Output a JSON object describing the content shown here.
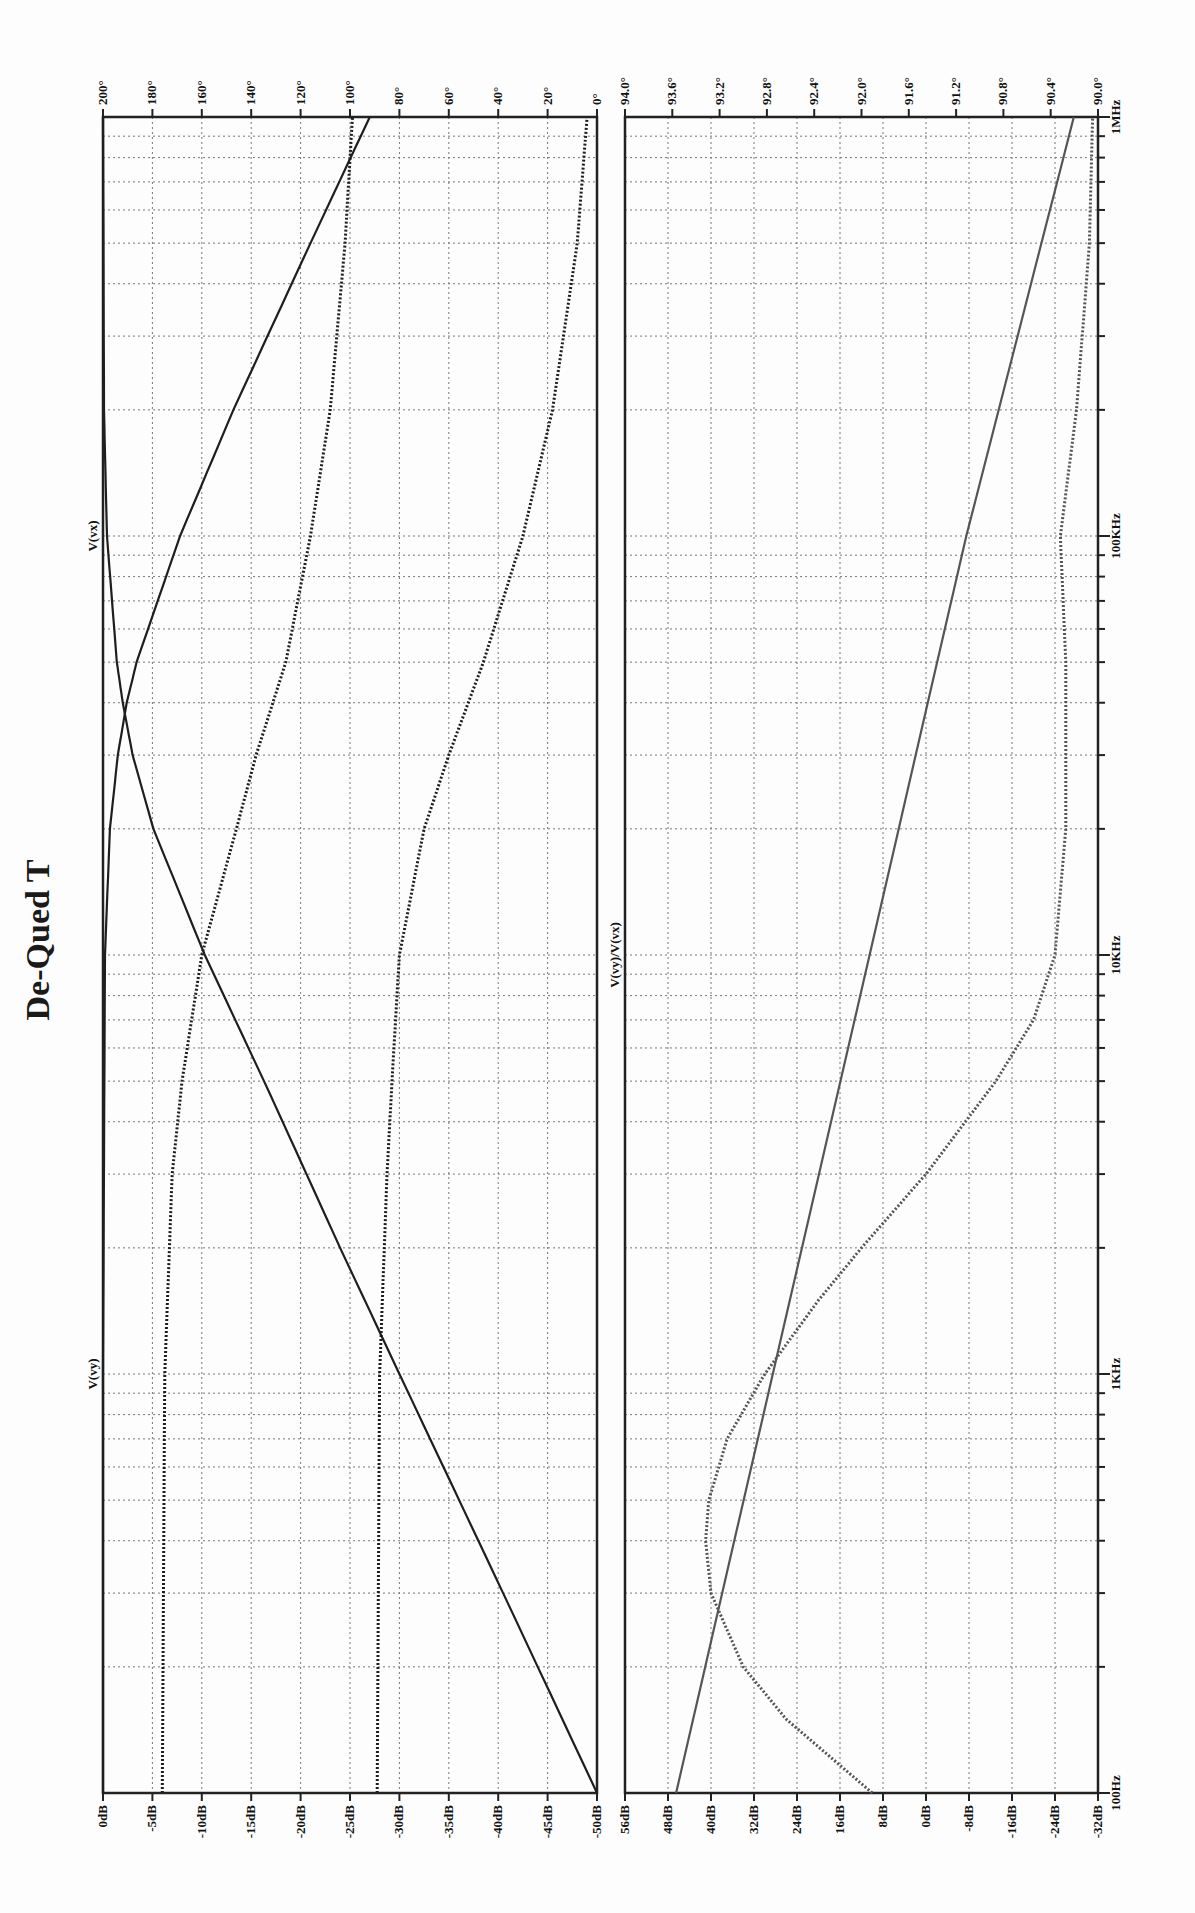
{
  "title": "De-Qued T",
  "chart_data": [
    {
      "type": "line",
      "title": "De-Qued T",
      "panel": "top",
      "xlabel": "Frequency",
      "x_scale": "log",
      "x_range": [
        100,
        1000000
      ],
      "x_ticks": [
        "100Hz",
        "1KHz",
        "10KHz",
        "100KHz",
        "1MHz"
      ],
      "ylabel_left": "Magnitude (dB)",
      "ylim_left": [
        -50,
        0
      ],
      "y_ticks_left": [
        "0dB",
        "-5dB",
        "-10dB",
        "-15dB",
        "-20dB",
        "-25dB",
        "-30dB",
        "-35dB",
        "-40dB",
        "-45dB",
        "-50dB"
      ],
      "ylabel_right": "Phase (deg)",
      "ylim_right": [
        0,
        200
      ],
      "y_ticks_right": [
        "200°",
        "180°",
        "160°",
        "140°",
        "120°",
        "100°",
        "80°",
        "60°",
        "40°",
        "20°",
        "0°"
      ],
      "grid": true,
      "trace_labels": [
        {
          "name": "V(vx)",
          "freq": 100000
        },
        {
          "name": "V(vy)",
          "freq": 1000
        }
      ],
      "series": [
        {
          "name": "V(vx) magnitude",
          "style": "solid",
          "axis": "left",
          "x": [
            100,
            300,
            1000,
            2000,
            3000,
            5000,
            10000,
            20000,
            30000,
            40000,
            50000,
            100000,
            200000,
            1000000
          ],
          "y": [
            -50.0,
            -40.5,
            -30.0,
            -24.0,
            -20.6,
            -16.3,
            -10.3,
            -5.1,
            -3.0,
            -2.0,
            -1.4,
            -0.4,
            -0.1,
            0.0
          ]
        },
        {
          "name": "V(vy) magnitude",
          "style": "solid",
          "axis": "left",
          "x": [
            100,
            1000,
            10000,
            20000,
            30000,
            40000,
            50000,
            100000,
            200000,
            500000,
            1000000
          ],
          "y": [
            0.0,
            0.0,
            -0.2,
            -0.7,
            -1.5,
            -2.4,
            -3.4,
            -7.8,
            -13.2,
            -21.0,
            -27.0
          ]
        },
        {
          "name": "V(vx) phase",
          "style": "dotted",
          "axis": "right",
          "x": [
            100,
            1000,
            3000,
            5000,
            10000,
            20000,
            30000,
            50000,
            100000,
            200000,
            500000,
            1000000
          ],
          "y": [
            176,
            175,
            172,
            168,
            160,
            146,
            138,
            126,
            116,
            108,
            102,
            99
          ]
        },
        {
          "name": "V(vy) phase",
          "style": "dotted",
          "axis": "right",
          "x": [
            100,
            1000,
            3000,
            5000,
            10000,
            20000,
            30000,
            50000,
            100000,
            200000,
            500000,
            1000000
          ],
          "y": [
            89,
            88,
            85,
            83,
            80,
            70,
            60,
            46,
            30,
            18,
            8,
            4
          ]
        }
      ]
    },
    {
      "type": "line",
      "panel": "bottom",
      "xlabel": "Frequency",
      "x_scale": "log",
      "x_range": [
        100,
        1000000
      ],
      "x_ticks": [
        "100Hz",
        "1KHz",
        "10KHz",
        "100KHz",
        "1MHz"
      ],
      "ylabel_left": "Magnitude (dB)",
      "ylim_left": [
        -32,
        56
      ],
      "y_ticks_left": [
        "56dB",
        "48dB",
        "40dB",
        "32dB",
        "24dB",
        "16dB",
        "8dB",
        "0dB",
        "-8dB",
        "-16dB",
        "-24dB",
        "-32dB"
      ],
      "ylabel_right": "Phase (deg)",
      "ylim_right": [
        90.0,
        94.4
      ],
      "y_ticks_right": [
        "94.0°",
        "93.6°",
        "93.2°",
        "92.8°",
        "92.4°",
        "92.0°",
        "91.6°",
        "91.2°",
        "90.8°",
        "90.4°",
        "90.0°"
      ],
      "grid": true,
      "trace_labels": [
        {
          "name": "V(vy)/V(vx)",
          "freq": 10000
        }
      ],
      "series": [
        {
          "name": "V(vy)/V(vx) magnitude",
          "style": "solid",
          "axis": "left",
          "x": [
            100,
            1000,
            10000,
            100000,
            1000000
          ],
          "y": [
            46.5,
            28.5,
            10.5,
            -7.5,
            -27.5
          ]
        },
        {
          "name": "V(vy)/V(vx) phase",
          "style": "dotted",
          "axis": "right",
          "x": [
            100,
            150,
            200,
            300,
            400,
            500,
            700,
            1000,
            1500,
            2000,
            3000,
            5000,
            7000,
            10000,
            20000,
            50000,
            100000,
            200000,
            500000,
            1000000
          ],
          "y": [
            92.1,
            92.9,
            93.3,
            93.6,
            93.65,
            93.62,
            93.45,
            93.1,
            92.6,
            92.2,
            91.6,
            90.95,
            90.6,
            90.4,
            90.3,
            90.3,
            90.35,
            90.2,
            90.08,
            90.05
          ]
        }
      ]
    }
  ]
}
